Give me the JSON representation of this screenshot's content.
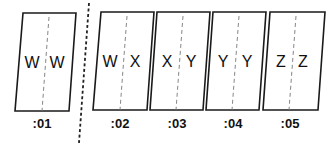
{
  "diagram": {
    "frames": [
      {
        "label": ":01",
        "left_field": "W",
        "right_field": "W"
      },
      {
        "label": ":02",
        "left_field": "W",
        "right_field": "X"
      },
      {
        "label": ":03",
        "left_field": "X",
        "right_field": "Y"
      },
      {
        "label": ":04",
        "left_field": "Y",
        "right_field": "Y"
      },
      {
        "label": ":05",
        "left_field": "Z",
        "right_field": "Z"
      }
    ],
    "divider": "dashed-separator-after-frame-01"
  }
}
